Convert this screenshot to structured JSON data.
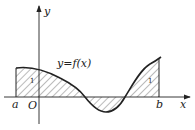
{
  "figure": {
    "type": "definite-integral-area-diagram",
    "curve_label": "y=f(x)",
    "axis_labels": {
      "x": "x",
      "y": "y"
    },
    "origin_label": "O",
    "bounds": {
      "left": "a",
      "right": "b"
    },
    "region_marks": [
      "1",
      "1"
    ],
    "colors": {
      "stroke": "#222222",
      "hatch": "#555555",
      "background": "#ffffff"
    }
  }
}
